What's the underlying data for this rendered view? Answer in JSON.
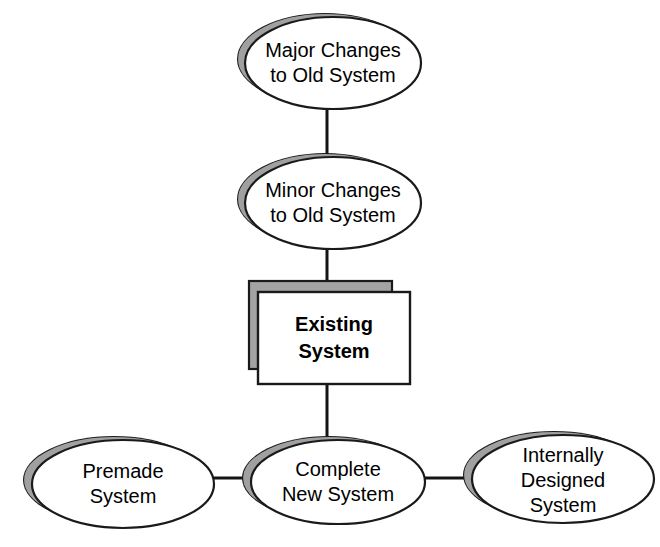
{
  "diagram": {
    "type": "tree-diagram",
    "canvas": {
      "width": 660,
      "height": 547,
      "background": "#ffffff"
    },
    "colors": {
      "shape_fill": "#ffffff",
      "shadow_fill": "#a0a0a0",
      "outline": "#1a1a1a",
      "text": "#000000",
      "connector": "#141414"
    },
    "nodes": [
      {
        "id": "major-changes",
        "shape": "ellipse",
        "lines": [
          "Major Changes",
          "to Old System"
        ],
        "bold": false,
        "cx": 325,
        "cy": 59,
        "rx": 88,
        "ry": 46
      },
      {
        "id": "minor-changes",
        "shape": "ellipse",
        "lines": [
          "Minor Changes",
          "to Old System"
        ],
        "bold": false,
        "cx": 325,
        "cy": 199,
        "rx": 88,
        "ry": 46
      },
      {
        "id": "existing-system",
        "shape": "box",
        "lines": [
          "Existing",
          "System"
        ],
        "bold": true,
        "x": 258,
        "y": 292,
        "width": 152,
        "height": 92,
        "shadow_x": 249,
        "shadow_y": 281,
        "shadow_width": 143,
        "shadow_height": 88
      },
      {
        "id": "premade-system",
        "shape": "ellipse",
        "lines": [
          "Premade",
          "System"
        ],
        "bold": false,
        "cx": 114,
        "cy": 480,
        "rx": 91,
        "ry": 44
      },
      {
        "id": "complete-new-system",
        "shape": "ellipse",
        "lines": [
          "Complete",
          "New System"
        ],
        "bold": false,
        "cx": 329,
        "cy": 478,
        "rx": 87,
        "ry": 42
      },
      {
        "id": "internally-designed-system",
        "shape": "ellipse",
        "lines": [
          "Internally",
          "Designed",
          "System"
        ],
        "bold": false,
        "cx": 554,
        "cy": 475,
        "rx": 91,
        "ry": 44
      }
    ],
    "connectors": [
      {
        "id": "major-to-minor",
        "orientation": "vertical",
        "x1": 327,
        "y1": 104,
        "x2": 327,
        "y2": 155
      },
      {
        "id": "minor-to-existing",
        "orientation": "vertical",
        "x1": 327,
        "y1": 244,
        "x2": 327,
        "y2": 282
      },
      {
        "id": "existing-to-complete",
        "orientation": "vertical",
        "x1": 327,
        "y1": 383,
        "x2": 327,
        "y2": 438
      },
      {
        "id": "premade-to-complete",
        "orientation": "horizontal",
        "x1": 204,
        "y1": 478,
        "x2": 242,
        "y2": 478
      },
      {
        "id": "complete-to-internally",
        "orientation": "horizontal",
        "x1": 415,
        "y1": 478,
        "x2": 463,
        "y2": 478
      }
    ]
  }
}
